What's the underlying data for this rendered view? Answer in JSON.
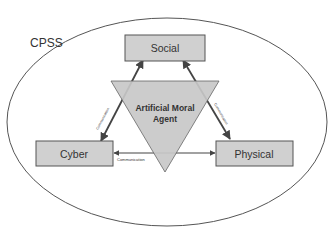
{
  "diagram": {
    "container_label": "CPSS",
    "nodes": {
      "social": "Social",
      "cyber": "Cyber",
      "physical": "Physical"
    },
    "center": {
      "line1": "Artificial Moral",
      "line2": "Agent"
    },
    "edges": {
      "cyber_social": "Communication",
      "social_physical": "Communication",
      "cyber_physical": "Communication"
    },
    "colors": {
      "box_fill": "#d0d0d0",
      "triangle_fill": "#c8c8c8",
      "stroke": "#555555",
      "text": "#333333"
    }
  }
}
